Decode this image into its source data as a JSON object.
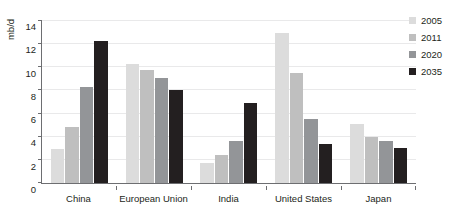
{
  "chart_data": {
    "type": "bar",
    "title": "",
    "xlabel": "",
    "ylabel": "mb/d",
    "ylim": [
      0,
      14
    ],
    "yticks": [
      0,
      2,
      4,
      6,
      8,
      10,
      12,
      14
    ],
    "grid": true,
    "legend_position": "right",
    "categories": [
      "China",
      "European Union",
      "India",
      "United States",
      "Japan"
    ],
    "series": [
      {
        "name": "2005",
        "color": "#dcdcdc",
        "values": [
          2.9,
          10.3,
          1.7,
          13.0,
          5.1
        ]
      },
      {
        "name": "2011",
        "color": "#bfbfbf",
        "values": [
          4.8,
          9.8,
          2.4,
          9.5,
          4.0
        ]
      },
      {
        "name": "2020",
        "color": "#939598",
        "values": [
          8.3,
          9.1,
          3.6,
          5.5,
          3.6
        ]
      },
      {
        "name": "2035",
        "color": "#231f20",
        "values": [
          12.3,
          8.0,
          6.9,
          3.4,
          3.0
        ]
      }
    ]
  }
}
